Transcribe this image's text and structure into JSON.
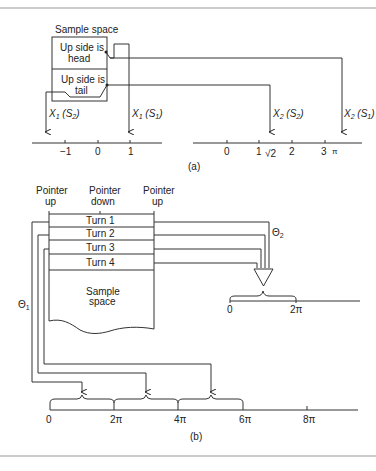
{
  "figure_a": {
    "sample_space_title": "Sample space",
    "outcomes": [
      {
        "line1": "Up side is",
        "line2": "head"
      },
      {
        "line1": "Up side is",
        "line2": "tail"
      }
    ],
    "mappings": {
      "x1_s2": {
        "var": "X",
        "sub": "1",
        "arg": "S",
        "argsub": "2"
      },
      "x1_s1": {
        "var": "X",
        "sub": "1",
        "arg": "S",
        "argsub": "1"
      },
      "x2_s2": {
        "var": "X",
        "sub": "2",
        "arg": "S",
        "argsub": "2"
      },
      "x2_s1": {
        "var": "X",
        "sub": "2",
        "arg": "S",
        "argsub": "1"
      }
    },
    "axis1_ticks": [
      "−1",
      "0",
      "1"
    ],
    "axis2_ticks": [
      "0",
      "1",
      "√2",
      "2",
      "3",
      "π"
    ],
    "caption": "(a)"
  },
  "figure_b": {
    "pointer_labels": [
      {
        "line1": "Pointer",
        "line2": "up"
      },
      {
        "line1": "Pointer",
        "line2": "down"
      },
      {
        "line1": "Pointer",
        "line2": "up"
      }
    ],
    "turns": [
      "Turn 1",
      "Turn 2",
      "Turn 3",
      "Turn 4"
    ],
    "sample_space": {
      "line1": "Sample",
      "line2": "space"
    },
    "theta1": {
      "sym": "Θ",
      "sub": "1"
    },
    "theta2": {
      "sym": "Θ",
      "sub": "2"
    },
    "axis_small_ticks": [
      "0",
      "2π"
    ],
    "axis_large_ticks": [
      "0",
      "2π",
      "4π",
      "6π",
      "8π"
    ],
    "caption": "(b)"
  }
}
